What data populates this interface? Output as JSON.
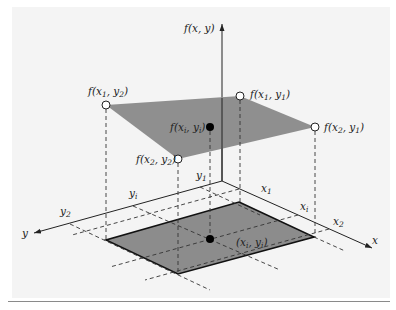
{
  "figure": {
    "type": "3d-bilinear-interpolation-diagram",
    "colors": {
      "surface_fill": "#8f8f8f",
      "base_fill": "#8c8c8c",
      "axis": "#222222",
      "background_panel": "#f4f4f4",
      "rule": "#8a8a8a"
    },
    "axes": {
      "vertical": "f(x, y)",
      "x": "x",
      "y": "y"
    },
    "axis_ticks": {
      "x": [
        "x1",
        "xi",
        "x2"
      ],
      "y": [
        "y1",
        "yi",
        "y2"
      ]
    },
    "labels": {
      "f_axis": {
        "base": "f(x, y)"
      },
      "f_x1_y2": {
        "pre": "f(x",
        "s1": "1",
        "mid": ", y",
        "s2": "2",
        "post": ")"
      },
      "f_x1_y1": {
        "pre": "f(x",
        "s1": "1",
        "mid": ", y",
        "s2": "1",
        "post": ")"
      },
      "f_x2_y1": {
        "pre": "f(x",
        "s1": "2",
        "mid": ", y",
        "s2": "1",
        "post": ")"
      },
      "f_x2_y2": {
        "pre": "f(x",
        "s1": "2",
        "mid": ", y",
        "s2": "2",
        "post": ")"
      },
      "f_xi_yi": {
        "pre": "f(x",
        "s1": "i",
        "mid": ", y",
        "s2": "i",
        "post": ")"
      },
      "p_xi_yi": {
        "pre": "(x",
        "s1": "i",
        "mid": ", y",
        "s2": "i",
        "post": ")"
      },
      "tick_x1": {
        "base": "x",
        "sub": "1"
      },
      "tick_xi": {
        "base": "x",
        "sub": "i"
      },
      "tick_x2": {
        "base": "x",
        "sub": "2"
      },
      "tick_y1": {
        "base": "y",
        "sub": "1"
      },
      "tick_yi": {
        "base": "y",
        "sub": "i"
      },
      "tick_y2": {
        "base": "y",
        "sub": "2"
      },
      "axis_x": "x",
      "axis_y": "y"
    },
    "points": {
      "known_values": [
        "f(x1, y1)",
        "f(x2, y1)",
        "f(x1, y2)",
        "f(x2, y2)"
      ],
      "interpolated": "f(xi, yi)",
      "query_point": "(xi, yi)"
    }
  }
}
